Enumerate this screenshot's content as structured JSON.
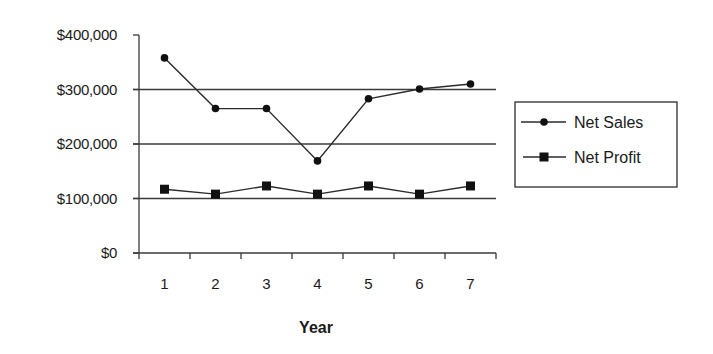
{
  "chart_data": {
    "type": "line",
    "title": "",
    "xlabel": "Year",
    "ylabel": "",
    "categories": [
      "1",
      "2",
      "3",
      "4",
      "5",
      "6",
      "7"
    ],
    "series": [
      {
        "name": "Net Sales",
        "marker": "circle",
        "values": [
          358000,
          265000,
          265000,
          169000,
          283000,
          301000,
          310000
        ]
      },
      {
        "name": "Net Profit",
        "marker": "square",
        "values": [
          117000,
          108000,
          123000,
          108000,
          123000,
          108000,
          123000
        ]
      }
    ],
    "ylim": [
      0,
      400000
    ],
    "yticks": [
      0,
      100000,
      200000,
      300000,
      400000
    ],
    "ytick_labels": [
      "$0",
      "$100,000",
      "$200,000",
      "$300,000",
      "$400,000"
    ],
    "grid": {
      "horizontal": true,
      "lines_at": [
        100000,
        200000,
        300000
      ]
    },
    "legend_position": "right"
  },
  "legend": {
    "items": [
      {
        "label": "Net Sales",
        "marker": "circle"
      },
      {
        "label": "Net Profit",
        "marker": "square"
      }
    ]
  },
  "colors": {
    "line": "#2b2b2b",
    "marker": "#111111",
    "grid": "#3a3a3a",
    "axis": "#3a3a3a"
  }
}
